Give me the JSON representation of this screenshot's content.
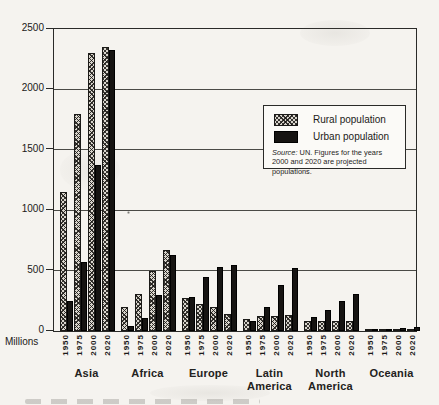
{
  "colors": {
    "paper": "#f5f3ef",
    "ink": "#1c1b19",
    "urban_fill": "#161412",
    "rural_fill_base": "#d9d5cd",
    "gridline": "#4a4a46"
  },
  "chart_data": {
    "type": "bar",
    "title": "",
    "ylabel": "Millions",
    "ylim": [
      0,
      2500
    ],
    "yticks": [
      0,
      500,
      1000,
      1500,
      2000,
      2500
    ],
    "grid": true,
    "legend_position": "upper right inside plot",
    "categories": [
      "Asia",
      "Africa",
      "Europe",
      "Latin America",
      "North America",
      "Oceania"
    ],
    "category_display": [
      [
        "Asia"
      ],
      [
        "Africa"
      ],
      [
        "Europe"
      ],
      [
        "Latin",
        "America"
      ],
      [
        "North",
        "America"
      ],
      [
        "Oceania"
      ]
    ],
    "x_group_labels": [
      "1950",
      "1975",
      "2000",
      "2020"
    ],
    "series": [
      {
        "name": "Rural population",
        "pattern": "hatched",
        "values": [
          [
            1150,
            1800,
            2300,
            2350
          ],
          [
            200,
            310,
            500,
            670
          ],
          [
            270,
            225,
            200,
            140
          ],
          [
            100,
            125,
            125,
            130
          ],
          [
            85,
            85,
            85,
            85
          ],
          [
            8,
            9,
            10,
            10
          ]
        ]
      },
      {
        "name": "Urban population",
        "pattern": "solid",
        "values": [
          [
            250,
            575,
            1375,
            2325
          ],
          [
            45,
            105,
            300,
            630
          ],
          [
            280,
            445,
            530,
            550
          ],
          [
            85,
            195,
            380,
            520
          ],
          [
            115,
            175,
            245,
            305
          ],
          [
            8,
            15,
            22,
            30
          ]
        ]
      }
    ],
    "source_note": {
      "prefix": "Source:",
      "text": "UN. Figures for the years 2000 and 2020 are projected populations."
    }
  }
}
